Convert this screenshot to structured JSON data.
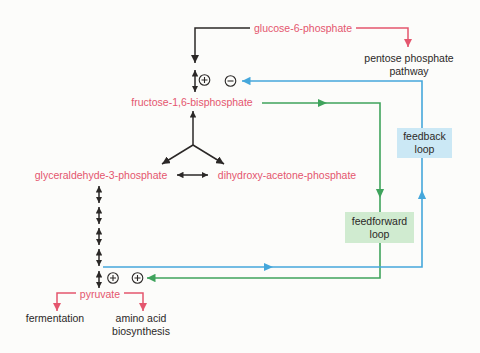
{
  "figure": {
    "colors": {
      "red": "#e4566e",
      "black": "#2b2827",
      "blue": "#45a7db",
      "green": "#3fa35c",
      "feedback_bg": "#cbe8f5",
      "feedforward_bg": "#d0ebd0"
    },
    "metabolites": {
      "glucose_6_phosphate": "glucose-6-phosphate",
      "fructose_16_bisphosphate": "fructose-1,6-bisphosphate",
      "glyceraldehyde_3_phosphate": "glyceraldehyde-3-phosphate",
      "dihydroxy_acetone_phosphate": "dihydroxy-acetone-phosphate",
      "pyruvate": "pyruvate"
    },
    "branches": {
      "pentose": {
        "line1": "pentose phosphate",
        "line2": "pathway"
      },
      "fermentation": "fermentation",
      "amino": {
        "line1": "amino acid",
        "line2": "biosynthesis"
      }
    },
    "loops": {
      "feedback": {
        "line1": "feedback",
        "line2": "loop"
      },
      "feedforward": {
        "line1": "feedforward",
        "line2": "loop"
      }
    },
    "regulators": [
      {
        "symbol": "+",
        "meaning": "activation",
        "site": "fructose-1,6-bisphosphate step"
      },
      {
        "symbol": "−",
        "meaning": "inhibition",
        "site": "fructose-1,6-bisphosphate step (feedback target)"
      },
      {
        "symbol": "+",
        "meaning": "activation",
        "site": "pyruvate step"
      },
      {
        "symbol": "+",
        "meaning": "activation",
        "site": "pyruvate step (feedforward target)"
      }
    ]
  }
}
